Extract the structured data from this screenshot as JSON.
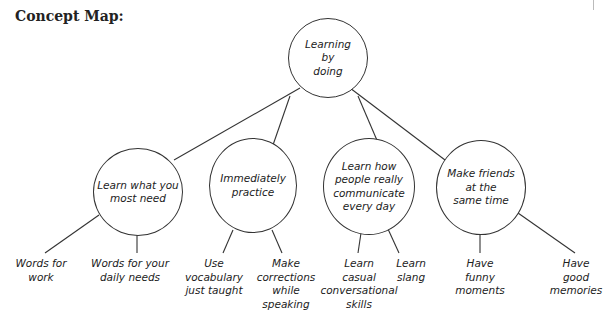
{
  "title": "Concept Map:",
  "root": {
    "label": "Learning\nby\ndoing"
  },
  "branches": [
    {
      "label": "Learn what you\nmost need",
      "children": [
        {
          "label": "Words for\nwork"
        },
        {
          "label": "Words for your\ndaily needs"
        }
      ]
    },
    {
      "label": "Immediately\npractice",
      "children": [
        {
          "label": "Use\nvocabulary\njust taught"
        },
        {
          "label": "Make\ncorrections\nwhile\nspeaking"
        }
      ]
    },
    {
      "label": "Learn how\npeople really\ncommunicate\nevery day",
      "children": [
        {
          "label": "Learn\ncasual\nconversational\nskills"
        },
        {
          "label": "Learn\nslang"
        }
      ]
    },
    {
      "label": "Make friends\nat the\nsame time",
      "children": [
        {
          "label": "Have\nfunny\nmoments"
        },
        {
          "label": "Have good\nmemories"
        }
      ]
    }
  ]
}
